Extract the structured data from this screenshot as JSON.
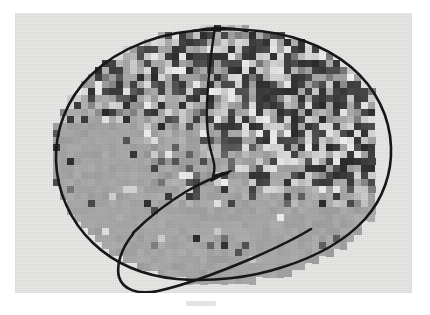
{
  "figure": {
    "modality": "grayscale statistical parametric map",
    "orientation": "left lateral view, anterior to the left",
    "caption_smudge": "",
    "panel": {
      "x": 15,
      "y": 13,
      "width": 397,
      "height": 280,
      "paper_color": "#e8e8e6",
      "page_color": "#ffffff"
    },
    "palette": {
      "paper": "#e8e8e6",
      "ink": "#1a1a1a",
      "brain_fill": "#b9b9b7",
      "mosaic_min": "#2b2b2b",
      "mosaic_mid": "#a9a9a7",
      "mosaic_max": "#f2f2f0"
    },
    "annotations": {
      "brain_outline": "hand-drawn lateral cortical contour",
      "central_sulcus": "vertical ink line descending from vertex",
      "sylvian_fissure": "ink line ascending posteriorly from anterior temporal pole",
      "temporal_lobe_outline": "closed ink loop delimiting temporal lobe"
    }
  },
  "chart_data": {
    "type": "heatmap",
    "xlabel": "",
    "ylabel": "",
    "grid": false,
    "legend": "none",
    "cell_size_px": 7,
    "cols": 46,
    "rows": 37,
    "origin": {
      "x": 38,
      "y": 12
    },
    "value_range": [
      0,
      9
    ],
    "colormap": "grayscale: 0 = darkest, 9 = brightest",
    "region_summary": [
      {
        "region": "superior frontal / precentral",
        "character": "dense alternating dark and light cells, high variance"
      },
      {
        "region": "parietal",
        "character": "mixed mid to dark cells with scattered bright cells"
      },
      {
        "region": "posterior temporo-occipital",
        "character": "highest contrast, checkerboard of near-black and near-white"
      },
      {
        "region": "inferior frontal / orbital",
        "character": "uniform mid grey, sparse isolated dark cells"
      },
      {
        "region": "temporal lobe",
        "character": "uniform mid grey with a few dark blocks"
      }
    ]
  }
}
